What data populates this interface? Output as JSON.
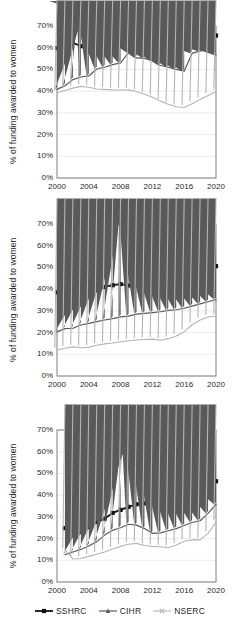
{
  "figure": {
    "ylabel": "% of funding awarded to women",
    "y_ticks": [
      "70%",
      "60%",
      "50%",
      "40%",
      "30%",
      "20%",
      "10%",
      "0%"
    ],
    "x_ticks": [
      "2000",
      "2004",
      "2008",
      "2012",
      "2016",
      "2020"
    ],
    "ylim": [
      0,
      70
    ],
    "xlim": [
      2000,
      2020
    ],
    "colors": {
      "sshrc": "#111111",
      "cihr": "#5a5a5a",
      "nserc": "#b4b4b4",
      "grid": "#e3e3e3",
      "axis": "#808080",
      "background": "#ffffff"
    }
  },
  "legend": {
    "position": "bottom-center",
    "items": [
      {
        "label": "SSHRC",
        "color": "#111111",
        "marker": "square"
      },
      {
        "label": "CIHR",
        "color": "#5a5a5a",
        "marker": "triangle"
      },
      {
        "label": "NSERC",
        "color": "#b4b4b4",
        "marker": "cross"
      }
    ]
  },
  "chart_data": [
    {
      "type": "line",
      "title": "Scholarships",
      "xlabel": "",
      "ylabel": "% of funding awarded to women",
      "ylim": [
        0,
        70
      ],
      "xlim": [
        2000,
        2020
      ],
      "grid": true,
      "x": [
        2000,
        2001,
        2002,
        2003,
        2004,
        2005,
        2006,
        2007,
        2008,
        2009,
        2010,
        2011,
        2012,
        2013,
        2014,
        2015,
        2016,
        2017,
        2018,
        2019,
        2020
      ],
      "series": [
        {
          "name": "SSHRC",
          "values": [
            59.8,
            61.8,
            62.3,
            60.7,
            62.0,
            62.2,
            63.2,
            64.0,
            65.2,
            64.0,
            63.8,
            63.9,
            64.1,
            63.9,
            63.5,
            62.6,
            62.2,
            63.2,
            64.0,
            64.4,
            65.6
          ]
        },
        {
          "name": "CIHR",
          "values": [
            40.8,
            42.5,
            45.3,
            46.5,
            47.0,
            50.2,
            51.0,
            52.2,
            53.0,
            57.8,
            55.3,
            55.1,
            54.0,
            51.8,
            51.0,
            50.0,
            49.2,
            57.5,
            58.4,
            59.4,
            56.6
          ]
        },
        {
          "name": "NSERC",
          "values": [
            39.3,
            40.3,
            41.4,
            42.2,
            41.8,
            41.0,
            40.8,
            40.6,
            40.5,
            40.6,
            39.8,
            38.6,
            37.2,
            35.4,
            34.0,
            32.8,
            32.5,
            34.2,
            36.2,
            38.0,
            39.7
          ]
        }
      ]
    },
    {
      "type": "line",
      "title": "Grants",
      "xlabel": "",
      "ylabel": "% of funding awarded to women",
      "ylim": [
        0,
        70
      ],
      "xlim": [
        2000,
        2020
      ],
      "grid": true,
      "x": [
        2000,
        2001,
        2002,
        2003,
        2004,
        2005,
        2006,
        2007,
        2008,
        2009,
        2010,
        2011,
        2012,
        2013,
        2014,
        2015,
        2016,
        2017,
        2018,
        2019,
        2020
      ],
      "series": [
        {
          "name": "SSHRC",
          "values": [
            38.5,
            37.8,
            40.3,
            39.8,
            40.2,
            39.5,
            41.0,
            41.8,
            42.3,
            41.7,
            42.6,
            44.3,
            45.5,
            45.2,
            46.8,
            48.4,
            49.6,
            51.0,
            52.2,
            54.0,
            50.6
          ]
        },
        {
          "name": "CIHR",
          "values": [
            20.3,
            21.8,
            22.0,
            23.5,
            24.2,
            25.0,
            25.8,
            26.4,
            27.2,
            27.6,
            28.5,
            28.8,
            29.2,
            29.6,
            30.2,
            30.5,
            31.2,
            32.2,
            33.2,
            34.2,
            35.2
          ]
        },
        {
          "name": "NSERC",
          "values": [
            12.0,
            12.8,
            13.4,
            13.0,
            13.2,
            14.2,
            14.8,
            15.2,
            15.8,
            16.2,
            16.6,
            16.8,
            17.0,
            16.5,
            17.2,
            18.4,
            20.4,
            23.6,
            25.8,
            27.2,
            27.6
          ]
        }
      ]
    },
    {
      "type": "line",
      "title": "Canada Research Chairs",
      "xlabel": "",
      "ylabel": "% of funding awarded to women",
      "ylim": [
        0,
        70
      ],
      "xlim": [
        2000,
        2020
      ],
      "grid": true,
      "x": [
        2001,
        2002,
        2003,
        2004,
        2005,
        2006,
        2007,
        2008,
        2009,
        2010,
        2011,
        2012,
        2013,
        2014,
        2015,
        2016,
        2017,
        2018,
        2019,
        2020
      ],
      "series": [
        {
          "name": "SSHRC",
          "values": [
            24.8,
            22.5,
            23.0,
            25.3,
            27.6,
            29.2,
            31.8,
            33.2,
            34.6,
            35.8,
            36.2,
            37.0,
            38.0,
            38.4,
            39.4,
            40.2,
            40.4,
            41.2,
            43.4,
            46.4
          ]
        },
        {
          "name": "CIHR",
          "values": [
            12.6,
            13.8,
            15.0,
            16.6,
            18.6,
            21.6,
            23.8,
            25.0,
            26.6,
            26.2,
            24.6,
            22.4,
            22.6,
            23.6,
            24.6,
            26.0,
            27.4,
            28.2,
            31.6,
            35.8
          ]
        },
        {
          "name": "NSERC",
          "values": [
            14.8,
            10.6,
            10.8,
            11.8,
            12.8,
            13.8,
            15.2,
            16.4,
            17.4,
            17.8,
            16.8,
            16.4,
            16.2,
            15.8,
            17.0,
            18.8,
            19.4,
            19.4,
            22.4,
            27.4
          ]
        }
      ]
    }
  ]
}
